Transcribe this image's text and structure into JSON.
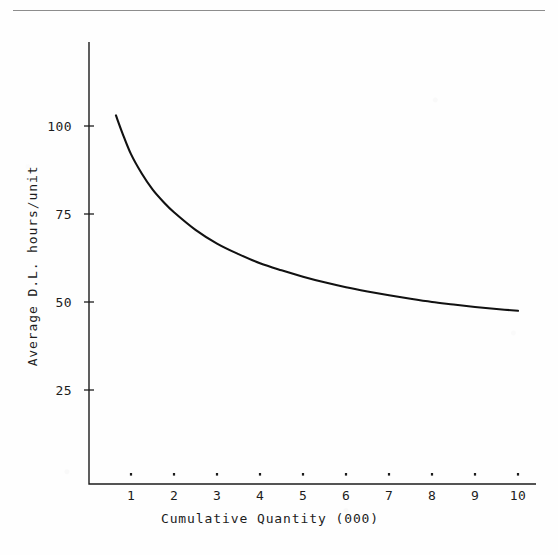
{
  "page": {
    "background_color": "#fefefe",
    "ink_color": "#1c1c1c",
    "top_rule_color": "#8d8d8d"
  },
  "chart_data": {
    "type": "line",
    "title": "",
    "subtitle": "",
    "xlabel": "Cumulative Quantity (000)",
    "ylabel": "Average D.L. hours/unit",
    "xlim": [
      0,
      10.4
    ],
    "ylim": [
      0,
      118
    ],
    "grid": false,
    "legend": false,
    "legend_position": "none",
    "x_ticks": [
      1,
      2,
      3,
      4,
      5,
      6,
      7,
      8,
      9,
      10
    ],
    "x_tick_labels": [
      "1",
      "2",
      "3",
      "4",
      "5",
      "6",
      "7",
      "8",
      "9",
      "10"
    ],
    "y_ticks": [
      25,
      50,
      75,
      100
    ],
    "y_tick_labels": [
      "25",
      "50",
      "75",
      "100"
    ],
    "series": [
      {
        "name": "Average direct labor hours per unit",
        "color": "#111111",
        "x": [
          0.65,
          0.8,
          1.0,
          1.25,
          1.5,
          1.75,
          2.0,
          2.5,
          3.0,
          3.5,
          4.0,
          4.5,
          5.0,
          5.5,
          6.0,
          6.5,
          7.0,
          7.5,
          8.0,
          8.5,
          9.0,
          9.5,
          10.0
        ],
        "values": [
          103.0,
          98.0,
          92.0,
          86.5,
          82.0,
          78.5,
          75.5,
          70.5,
          66.6,
          63.6,
          61.0,
          59.0,
          57.2,
          55.6,
          54.2,
          53.0,
          51.9,
          50.9,
          50.0,
          49.3,
          48.6,
          48.0,
          47.5
        ]
      }
    ],
    "annotations": []
  },
  "axis": {
    "x_label": "Cumulative Quantity (000)",
    "y_label": "Average D.L. hours/unit"
  }
}
